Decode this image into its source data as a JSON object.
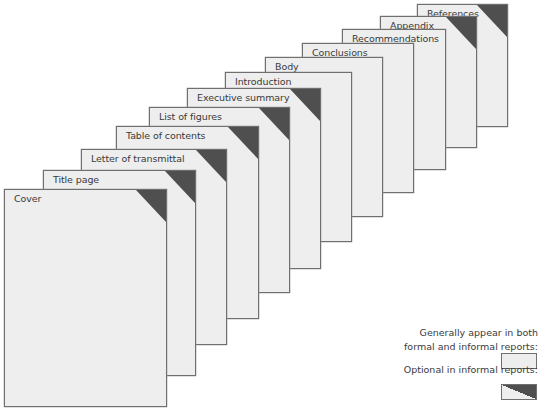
{
  "diagram": {
    "pages": [
      {
        "label": "Cover",
        "optional": true,
        "x": 4,
        "y": 189,
        "w": 163,
        "h": 218
      },
      {
        "label": "Title page",
        "optional": true,
        "x": 43,
        "y": 170,
        "w": 153,
        "h": 206
      },
      {
        "label": "Letter of transmittal",
        "optional": true,
        "x": 81,
        "y": 149,
        "w": 146,
        "h": 196
      },
      {
        "label": "Table of contents",
        "optional": true,
        "x": 116,
        "y": 126,
        "w": 143,
        "h": 193
      },
      {
        "label": "List of figures",
        "optional": true,
        "x": 149,
        "y": 107,
        "w": 141,
        "h": 186
      },
      {
        "label": "Executive summary",
        "optional": true,
        "x": 187,
        "y": 88,
        "w": 134,
        "h": 181
      },
      {
        "label": "Introduction",
        "optional": false,
        "x": 225,
        "y": 72,
        "w": 127,
        "h": 170
      },
      {
        "label": "Body",
        "optional": false,
        "x": 265,
        "y": 57,
        "w": 118,
        "h": 160
      },
      {
        "label": "Conclusions",
        "optional": false,
        "x": 302,
        "y": 43,
        "w": 112,
        "h": 150
      },
      {
        "label": "Recommendations",
        "optional": false,
        "x": 342,
        "y": 29,
        "w": 104,
        "h": 141
      },
      {
        "label": "Appendix",
        "optional": true,
        "x": 380,
        "y": 16,
        "w": 97,
        "h": 132
      },
      {
        "label": "References",
        "optional": true,
        "x": 417,
        "y": 4,
        "w": 91,
        "h": 123
      }
    ]
  },
  "legend": {
    "both_label_line1": "Generally appear in both",
    "both_label_line2": "formal and informal reports:",
    "optional_label": "Optional in informal reports:"
  },
  "colors": {
    "page_fill": "#eeeeee",
    "page_border": "#6f6f6f",
    "corner_fill": "#4f4f4f",
    "text": "#3a3a3a"
  }
}
